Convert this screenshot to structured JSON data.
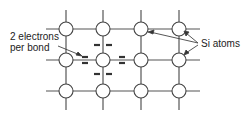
{
  "diagram": {
    "labels": {
      "electrons_line1": "2 electrons",
      "electrons_line2": "per bond",
      "atoms": "Si atoms"
    },
    "grid": {
      "columns_x": [
        66,
        103,
        141,
        179
      ],
      "rows_y": [
        29,
        60,
        91
      ],
      "atom_radius": 7,
      "line_x_range": [
        46,
        200
      ],
      "line_y_range": [
        10,
        110
      ]
    },
    "colors": {
      "line": "#555555",
      "atom_fill": "#ffffff",
      "electron": "#333333",
      "text": "#222222"
    }
  }
}
